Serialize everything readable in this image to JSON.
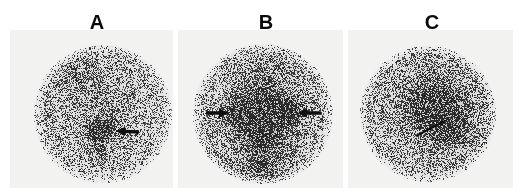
{
  "figure": {
    "kind": "nuclear-medicine-scintigraphy-figure",
    "width": 523,
    "height": 194,
    "background_color": "#ffffff",
    "panel_field_color": "#f2f2f0",
    "ink_color": "#101010",
    "label_font_size": 20
  },
  "panels": [
    {
      "id": "A",
      "label": "A",
      "label_x": 97,
      "label_y": 12,
      "field": {
        "x": 10,
        "y": 30,
        "w": 163,
        "h": 158
      },
      "disc": {
        "cx": 103,
        "cy": 114,
        "r": 69
      },
      "noise": {
        "seed": 11,
        "density": 0.46,
        "dot_size": 1.25,
        "base_gray": 236
      },
      "hotspots": [
        {
          "cx": 101,
          "cy": 131,
          "rx": 13,
          "ry": 10,
          "intensity": 0.92,
          "falloff": 2.0
        },
        {
          "cx": 100,
          "cy": 152,
          "rx": 7,
          "ry": 9,
          "intensity": 0.42,
          "falloff": 1.7
        },
        {
          "cx": 103,
          "cy": 100,
          "rx": 26,
          "ry": 34,
          "intensity": 0.22,
          "falloff": 1.4
        },
        {
          "cx": 74,
          "cy": 72,
          "rx": 20,
          "ry": 16,
          "intensity": 0.3,
          "falloff": 1.5
        },
        {
          "cx": 103,
          "cy": 114,
          "rx": 62,
          "ry": 62,
          "intensity": 0.14,
          "falloff": 1.2
        }
      ],
      "arrows": [
        {
          "name": "arrow-focal-uptake-a",
          "type": "solid",
          "tip_x": 116,
          "tip_y": 131,
          "tail_x": 139,
          "tail_y": 132,
          "shaft_width": 3.4,
          "head_length": 9,
          "head_width": 9.5
        }
      ]
    },
    {
      "id": "B",
      "label": "B",
      "label_x": 266,
      "label_y": 12,
      "field": {
        "x": 178,
        "y": 30,
        "w": 165,
        "h": 158
      },
      "disc": {
        "cx": 263,
        "cy": 114,
        "r": 70
      },
      "noise": {
        "seed": 29,
        "density": 0.47,
        "dot_size": 1.25,
        "base_gray": 236
      },
      "hotspots": [
        {
          "cx": 241,
          "cy": 113,
          "rx": 16,
          "ry": 14,
          "intensity": 0.88,
          "falloff": 1.9
        },
        {
          "cx": 288,
          "cy": 112,
          "rx": 14,
          "ry": 13,
          "intensity": 0.82,
          "falloff": 1.9
        },
        {
          "cx": 264,
          "cy": 120,
          "rx": 11,
          "ry": 16,
          "intensity": 0.6,
          "falloff": 1.7
        },
        {
          "cx": 264,
          "cy": 137,
          "rx": 24,
          "ry": 18,
          "intensity": 0.52,
          "falloff": 1.6
        },
        {
          "cx": 264,
          "cy": 90,
          "rx": 27,
          "ry": 28,
          "intensity": 0.4,
          "falloff": 1.5
        },
        {
          "cx": 264,
          "cy": 168,
          "rx": 24,
          "ry": 16,
          "intensity": 0.45,
          "falloff": 1.5
        },
        {
          "cx": 264,
          "cy": 120,
          "rx": 56,
          "ry": 60,
          "intensity": 0.2,
          "falloff": 1.3
        }
      ],
      "arrows": [
        {
          "name": "arrow-left-lobe-b",
          "type": "solid",
          "tip_x": 228,
          "tip_y": 113,
          "tail_x": 206,
          "tail_y": 113,
          "shaft_width": 3.4,
          "head_length": 9,
          "head_width": 9.5
        },
        {
          "name": "arrow-right-lobe-b",
          "type": "solid",
          "tip_x": 298,
          "tip_y": 113,
          "tail_x": 321,
          "tail_y": 113,
          "shaft_width": 3.4,
          "head_length": 9,
          "head_width": 9.5
        }
      ]
    },
    {
      "id": "C",
      "label": "C",
      "label_x": 432,
      "label_y": 12,
      "field": {
        "x": 348,
        "y": 30,
        "w": 165,
        "h": 158
      },
      "disc": {
        "cx": 428,
        "cy": 114,
        "r": 68
      },
      "noise": {
        "seed": 47,
        "density": 0.45,
        "dot_size": 1.25,
        "base_gray": 236
      },
      "hotspots": [
        {
          "cx": 444,
          "cy": 117,
          "rx": 20,
          "ry": 20,
          "intensity": 0.78,
          "falloff": 1.8
        },
        {
          "cx": 432,
          "cy": 100,
          "rx": 26,
          "ry": 22,
          "intensity": 0.48,
          "falloff": 1.6
        },
        {
          "cx": 452,
          "cy": 132,
          "rx": 18,
          "ry": 16,
          "intensity": 0.4,
          "falloff": 1.6
        },
        {
          "cx": 428,
          "cy": 110,
          "rx": 46,
          "ry": 46,
          "intensity": 0.22,
          "falloff": 1.3
        },
        {
          "cx": 428,
          "cy": 114,
          "rx": 62,
          "ry": 62,
          "intensity": 0.12,
          "falloff": 1.2
        }
      ],
      "arrows": [
        {
          "name": "arrow-diffuse-uptake-c",
          "type": "thin-line",
          "tip_x": 447,
          "tip_y": 120,
          "tail_x": 416,
          "tail_y": 136,
          "shaft_width": 2.0,
          "head_length": 7,
          "head_width": 5
        }
      ]
    }
  ]
}
